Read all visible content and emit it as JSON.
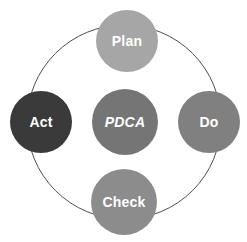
{
  "diagram": {
    "type": "cycle-diagram",
    "canvas": {
      "width": 247,
      "height": 242,
      "background": "#ffffff"
    },
    "ring": {
      "name": "outer-cycle-ring",
      "center_x": 124,
      "center_y": 122,
      "radius": 97,
      "stroke_color": "#4f4f4f",
      "stroke_width": 1,
      "fill": "none"
    },
    "center_node": {
      "label": "PDCA",
      "color": "#757575",
      "text_color": "#ffffff",
      "italic": true,
      "center_x": 125,
      "center_y": 122,
      "radius": 33
    },
    "nodes": [
      {
        "id": "plan",
        "label": "Plan",
        "color": "#a6a6a6",
        "text_color": "#ffffff",
        "position": "top",
        "center_x": 127,
        "center_y": 41,
        "radius": 31
      },
      {
        "id": "do",
        "label": "Do",
        "color": "#808080",
        "text_color": "#ffffff",
        "position": "right",
        "center_x": 209,
        "center_y": 122,
        "radius": 31
      },
      {
        "id": "check",
        "label": "Check",
        "color": "#8c8c8c",
        "text_color": "#ffffff",
        "position": "bottom",
        "center_x": 124,
        "center_y": 202,
        "radius": 33
      },
      {
        "id": "act",
        "label": "Act",
        "color": "#3a3a3a",
        "text_color": "#ffffff",
        "position": "left",
        "center_x": 41,
        "center_y": 122,
        "radius": 31
      }
    ]
  }
}
